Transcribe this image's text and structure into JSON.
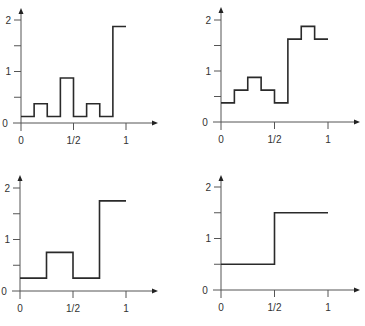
{
  "colors": {
    "line": "#2a2a2a",
    "axis": "#555555",
    "text": "#333333",
    "background": "#ffffff"
  },
  "chart_data": [
    {
      "type": "line",
      "subtype": "step",
      "position": "top-left",
      "title": "",
      "xlabel": "",
      "ylabel": "",
      "xlim": [
        0,
        1
      ],
      "ylim": [
        0,
        2
      ],
      "grid": false,
      "x_ticks": [
        0,
        0.5,
        1
      ],
      "x_tick_labels": [
        "0",
        "1/2",
        "1"
      ],
      "y_ticks": [
        0,
        0.5,
        1,
        1.5,
        2
      ],
      "y_tick_labels": [
        "0",
        "",
        "1",
        "",
        "2"
      ],
      "x": [
        0,
        0.125,
        0.25,
        0.375,
        0.5,
        0.625,
        0.75,
        0.875,
        1
      ],
      "values": [
        0.125,
        0.375,
        0.125,
        0.875,
        0.125,
        0.375,
        0.125,
        1.875
      ]
    },
    {
      "type": "line",
      "subtype": "step",
      "position": "top-right",
      "title": "",
      "xlabel": "",
      "ylabel": "",
      "xlim": [
        0,
        1
      ],
      "ylim": [
        0,
        2
      ],
      "grid": false,
      "x_ticks": [
        0,
        0.5,
        1
      ],
      "x_tick_labels": [
        "0",
        "1/2",
        "1"
      ],
      "y_ticks": [
        0,
        0.5,
        1,
        1.5,
        2
      ],
      "y_tick_labels": [
        "0",
        "",
        "1",
        "",
        "2"
      ],
      "x": [
        0,
        0.125,
        0.25,
        0.375,
        0.5,
        0.625,
        0.75,
        0.875,
        1
      ],
      "values": [
        0.375,
        0.625,
        0.875,
        0.625,
        0.375,
        1.625,
        1.875,
        1.625
      ]
    },
    {
      "type": "line",
      "subtype": "step",
      "position": "bottom-left",
      "title": "",
      "xlabel": "",
      "ylabel": "",
      "xlim": [
        0,
        1
      ],
      "ylim": [
        0,
        2
      ],
      "grid": false,
      "x_ticks": [
        0,
        0.5,
        1
      ],
      "x_tick_labels": [
        "0",
        "1/2",
        "1"
      ],
      "y_ticks": [
        0,
        0.5,
        1,
        1.5,
        2
      ],
      "y_tick_labels": [
        "0",
        "",
        "1",
        "",
        "2"
      ],
      "x": [
        0,
        0.25,
        0.5,
        0.75,
        1
      ],
      "values": [
        0.25,
        0.75,
        0.25,
        1.75
      ]
    },
    {
      "type": "line",
      "subtype": "step",
      "position": "bottom-right",
      "title": "",
      "xlabel": "",
      "ylabel": "",
      "xlim": [
        0,
        1
      ],
      "ylim": [
        0,
        2
      ],
      "grid": false,
      "x_ticks": [
        0,
        0.5,
        1
      ],
      "x_tick_labels": [
        "0",
        "1/2",
        "1"
      ],
      "y_ticks": [
        0,
        0.5,
        1,
        1.5,
        2
      ],
      "y_tick_labels": [
        "0",
        "",
        "1",
        "",
        "2"
      ],
      "x": [
        0,
        0.5,
        1
      ],
      "values": [
        0.5,
        1.5
      ]
    }
  ],
  "layout": {
    "panels": [
      {
        "ox": 21,
        "oy": 123,
        "xscale": 105,
        "yscale": 51.5,
        "ytop": 8,
        "xend": 158
      },
      {
        "ox": 221,
        "oy": 122,
        "xscale": 107,
        "yscale": 51,
        "ytop": 7,
        "xend": 360
      },
      {
        "ox": 20,
        "oy": 291,
        "xscale": 106,
        "yscale": 51.5,
        "ytop": 175,
        "xend": 158
      },
      {
        "ox": 221,
        "oy": 290,
        "xscale": 107,
        "yscale": 51.5,
        "ytop": 175,
        "xend": 360
      }
    ]
  }
}
